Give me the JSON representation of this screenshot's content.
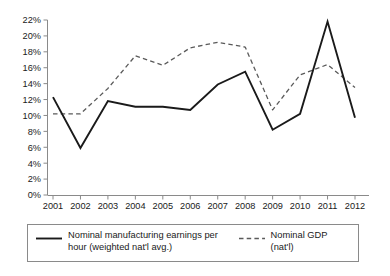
{
  "chart_data": {
    "type": "line",
    "title": "",
    "subtitle": "",
    "xlabel": "",
    "ylabel": "",
    "categories": [
      "2001",
      "2002",
      "2003",
      "2004",
      "2005",
      "2006",
      "2007",
      "2008",
      "2009",
      "2010",
      "2011",
      "2012"
    ],
    "x_tick_labels": [
      "2001",
      "2002",
      "2003",
      "2004",
      "2005",
      "2006",
      "2007",
      "2008",
      "2009",
      "2010",
      "2011",
      "2012"
    ],
    "y_tick_labels": [
      "0%",
      "2%",
      "4%",
      "6%",
      "8%",
      "10%",
      "12%",
      "14%",
      "16%",
      "18%",
      "20%",
      "22%"
    ],
    "y_tick_values": [
      0,
      2,
      4,
      6,
      8,
      10,
      12,
      14,
      16,
      18,
      20,
      22
    ],
    "ylim": [
      0,
      22
    ],
    "grid": false,
    "legend_position": "bottom",
    "series": [
      {
        "name": "Nominal manufacturing earnings per hour (weighted nat'l avg.)",
        "style": "solid",
        "color": "#1a1a1a",
        "values": [
          12.3,
          5.9,
          11.8,
          11.1,
          11.1,
          10.7,
          13.9,
          15.5,
          8.2,
          10.2,
          21.8,
          9.7
        ]
      },
      {
        "name": "Nominal GDP (nat'l)",
        "style": "dashed",
        "color": "#5a5a5a",
        "values": [
          10.2,
          10.2,
          13.4,
          17.5,
          16.3,
          18.5,
          19.2,
          18.6,
          10.7,
          15.1,
          16.4,
          13.5
        ]
      }
    ]
  },
  "legend": {
    "entries": [
      {
        "label": "Nominal manufacturing earnings per\nhour (weighted nat'l avg.)",
        "style": "solid"
      },
      {
        "label": "Nominal GDP (nat'l)",
        "style": "dashed"
      }
    ]
  }
}
